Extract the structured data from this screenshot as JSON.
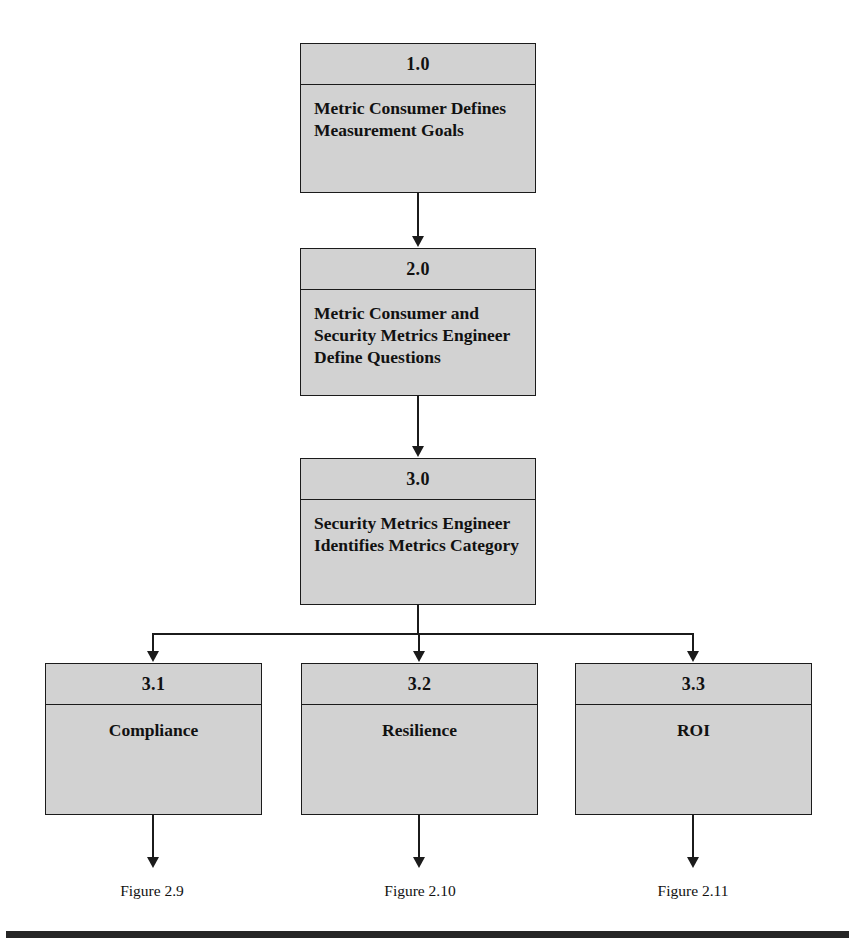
{
  "diagram": {
    "type": "flowchart",
    "fill_color": "#d2d2d2",
    "line_color": "#1b1b1b",
    "nodes": [
      {
        "id": "1.0",
        "label": "Metric Consumer Defines Measurement Goals",
        "align": "left"
      },
      {
        "id": "2.0",
        "label": "Metric Consumer and Security Metrics Engineer Define Questions",
        "align": "left"
      },
      {
        "id": "3.0",
        "label": "Security Metrics Engineer Identifies Metrics Category",
        "align": "left"
      },
      {
        "id": "3.1",
        "label": "Compliance",
        "align": "center"
      },
      {
        "id": "3.2",
        "label": "Resilience",
        "align": "center"
      },
      {
        "id": "3.3",
        "label": "ROI",
        "align": "center"
      }
    ],
    "figure_refs": [
      {
        "text": "Figure 2.9"
      },
      {
        "text": "Figure 2.10"
      },
      {
        "text": "Figure 2.11"
      }
    ]
  }
}
